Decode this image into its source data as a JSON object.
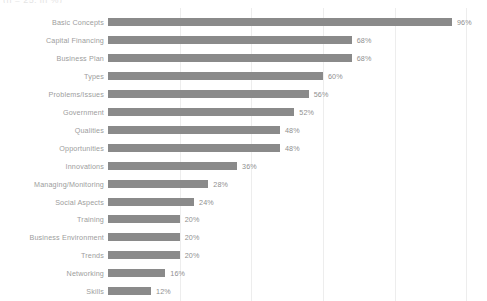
{
  "clipped_header": {
    "text": "(n = 25, in %)"
  },
  "chart_data": {
    "type": "bar",
    "orientation": "horizontal",
    "title": "",
    "subtitle": "",
    "xlabel": "",
    "ylabel": "",
    "xlim": [
      0,
      100
    ],
    "grid": true,
    "gridlines_percent": [
      20,
      40,
      60,
      80,
      100
    ],
    "legend": "none",
    "value_suffix": "%",
    "bar_color": "#8a8a8a",
    "gridline_color": "#ededed",
    "label_color": "#9d9d9d",
    "background": "#ffffff",
    "categories": [
      "Basic Concepts",
      "Capital Financing",
      "Business Plan",
      "Types",
      "Problems/Issues",
      "Government",
      "Qualities",
      "Opportunities",
      "Innovations",
      "Managing/Monitoring",
      "Social Aspects",
      "Training",
      "Business Environment",
      "Trends",
      "Networking",
      "Skills"
    ],
    "values": [
      96,
      68,
      68,
      60,
      56,
      52,
      48,
      48,
      36,
      28,
      24,
      20,
      20,
      20,
      16,
      12
    ],
    "value_labels": [
      "96%",
      "68%",
      "68%",
      "60%",
      "56%",
      "52%",
      "48%",
      "48%",
      "36%",
      "28%",
      "24%",
      "20%",
      "20%",
      "20%",
      "16%",
      "12%"
    ]
  }
}
